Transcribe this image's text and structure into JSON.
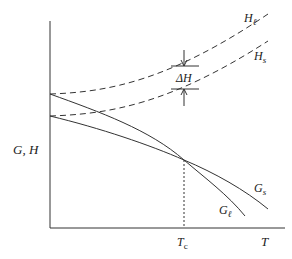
{
  "diagram": {
    "y_axis_label": "G, H",
    "x_axis_label": "T",
    "tc_label": "T",
    "tc_subscript": "c",
    "delta_h_label": "ΔH",
    "curves": {
      "H_l": {
        "label": "H",
        "sub": "ℓ",
        "style": "dashed"
      },
      "H_s": {
        "label": "H",
        "sub": "s",
        "style": "dashed"
      },
      "G_s": {
        "label": "G",
        "sub": "s",
        "style": "solid"
      },
      "G_l": {
        "label": "G",
        "sub": "ℓ",
        "style": "solid"
      }
    },
    "colors": {
      "line": "#333333",
      "background": "#ffffff"
    }
  }
}
